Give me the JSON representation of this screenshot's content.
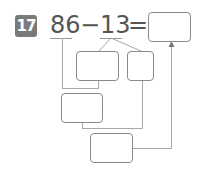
{
  "problem": {
    "number": "17",
    "minuend": "86",
    "operator": "−",
    "subtrahend": "13",
    "equals": "=",
    "answer_value": ""
  },
  "boxes": {
    "split_a": "",
    "split_b": "",
    "intermediate": "",
    "final": ""
  },
  "colors": {
    "badge": "#7a7a7a",
    "text": "#555555",
    "box_border": "#8a8a8a",
    "line": "#a0a0a0"
  }
}
